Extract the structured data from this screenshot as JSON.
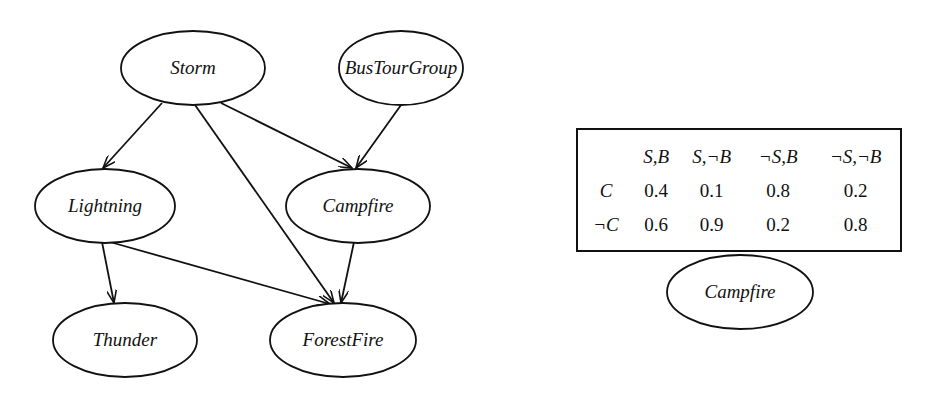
{
  "diagram": {
    "nodes": [
      {
        "id": "storm",
        "label": "Storm",
        "cx": 193,
        "cy": 68,
        "rx": 72,
        "ry": 37
      },
      {
        "id": "bustourgroup",
        "label": "BusTourGroup",
        "cx": 401,
        "cy": 68,
        "rx": 62,
        "ry": 37
      },
      {
        "id": "lightning",
        "label": "Lightning",
        "cx": 105,
        "cy": 206,
        "rx": 70,
        "ry": 37
      },
      {
        "id": "campfire",
        "label": "Campfire",
        "cx": 358,
        "cy": 206,
        "rx": 72,
        "ry": 37
      },
      {
        "id": "thunder",
        "label": "Thunder",
        "cx": 125,
        "cy": 340,
        "rx": 72,
        "ry": 37
      },
      {
        "id": "forestfire",
        "label": "ForestFire",
        "cx": 343,
        "cy": 340,
        "rx": 73,
        "ry": 37
      }
    ],
    "edges": [
      {
        "from": "Storm",
        "to": "Lightning"
      },
      {
        "from": "Storm",
        "to": "Campfire"
      },
      {
        "from": "Storm",
        "to": "ForestFire"
      },
      {
        "from": "BusTourGroup",
        "to": "Campfire"
      },
      {
        "from": "Lightning",
        "to": "Thunder"
      },
      {
        "from": "Lightning",
        "to": "ForestFire"
      },
      {
        "from": "Campfire",
        "to": "ForestFire"
      }
    ]
  },
  "cpt": {
    "node_label": "Campfire",
    "columns": [
      "S,B",
      "S,¬B",
      "¬S,B",
      "¬S,¬B"
    ],
    "rows": [
      {
        "label": "C",
        "values": [
          "0.4",
          "0.1",
          "0.8",
          "0.2"
        ]
      },
      {
        "label": "¬C",
        "values": [
          "0.6",
          "0.9",
          "0.2",
          "0.8"
        ]
      }
    ]
  }
}
